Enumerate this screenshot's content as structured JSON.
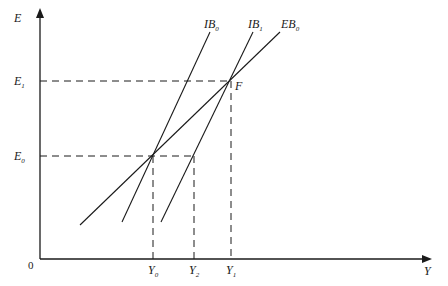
{
  "diagram": {
    "type": "macroeconomic equilibrium diagram (internal/external balance)",
    "axes": {
      "y_axis": {
        "label": "E"
      },
      "x_axis": {
        "label": "Y"
      },
      "origin": "0"
    },
    "curves": [
      {
        "id": "IB0",
        "base": "IB",
        "sub": "0"
      },
      {
        "id": "IB1",
        "base": "IB",
        "sub": "1"
      },
      {
        "id": "EB0",
        "base": "EB",
        "sub": "0"
      }
    ],
    "y_ticks": [
      {
        "base": "E",
        "sub": "1"
      },
      {
        "base": "E",
        "sub": "0"
      }
    ],
    "x_ticks": [
      {
        "base": "Y",
        "sub": "0"
      },
      {
        "base": "Y",
        "sub": "2"
      },
      {
        "base": "Y",
        "sub": "1"
      }
    ],
    "points": [
      {
        "label": "F"
      }
    ]
  }
}
